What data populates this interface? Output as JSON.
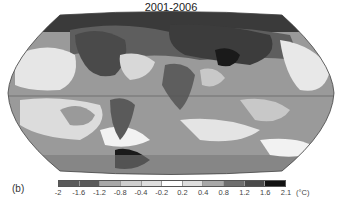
{
  "figure": {
    "title": "2001-2006",
    "panel_label": "(b)",
    "projection": "Robinson-style world map (grayscale temperature anomaly)"
  },
  "colorbar": {
    "unit": "(°C)",
    "tick_labels": [
      "-2",
      "-1.6",
      "-1.2",
      "-0.8",
      "-0.4",
      "-0.2",
      "0.2",
      "0.4",
      "0.8",
      "1.2",
      "1.6",
      "2.1"
    ],
    "segment_colors": [
      "#5a5a5a",
      "#5a5a5a",
      "#a8a8a8",
      "#cfcfcf",
      "#dedede",
      "#ffffff",
      "#dedede",
      "#a8a8a8",
      "#6e6e6e",
      "#4a4a4a",
      "#111111"
    ]
  },
  "map_colors": {
    "ocean_outline": "#444444",
    "equator": "#555555",
    "very_warm": "#1a1a1a",
    "warm": "#5e5e5e",
    "mild": "#9a9a9a",
    "light": "#c8c8c8",
    "neutral": "#f2f2f2"
  }
}
